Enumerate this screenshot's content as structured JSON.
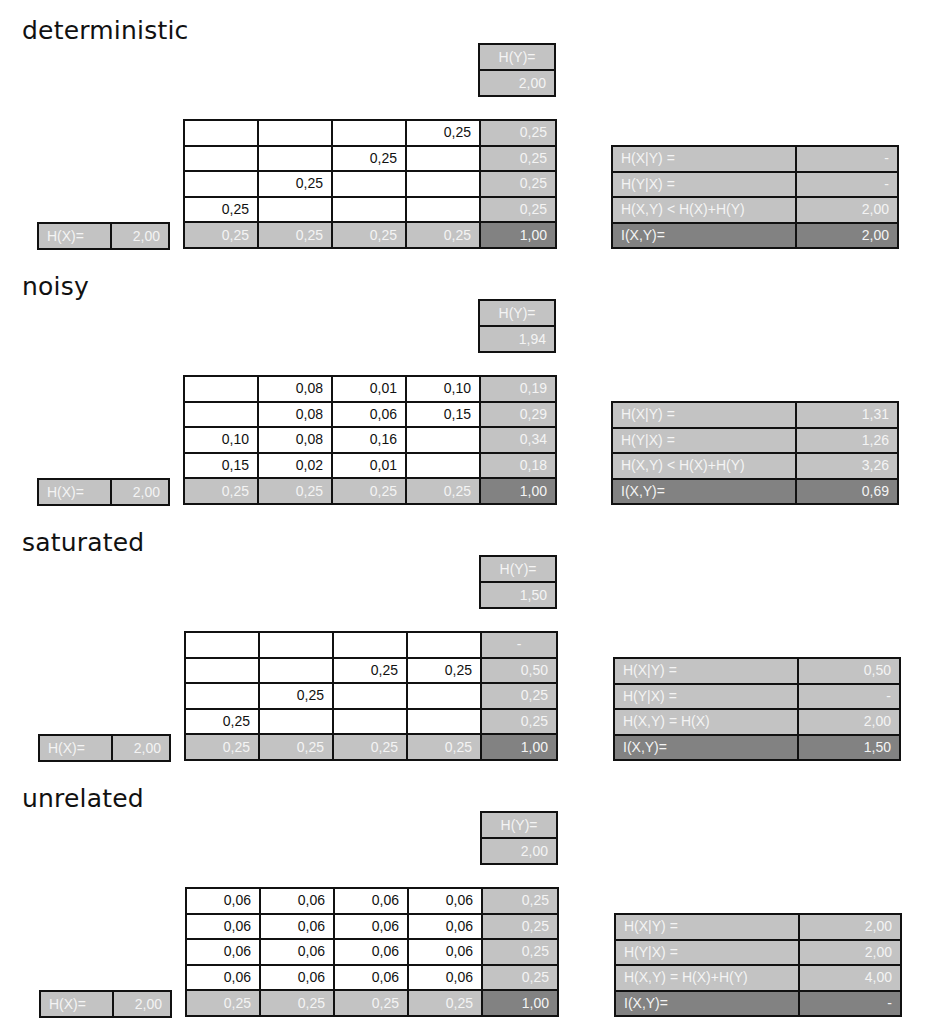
{
  "colors": {
    "light_gray": "#c3c3c3",
    "dark_gray": "#828282",
    "border": "#111111"
  },
  "sections": [
    {
      "title": "deterministic",
      "hy": {
        "label": "H(Y)=",
        "value": "2,00"
      },
      "grid": [
        [
          "",
          "",
          "",
          "0,25",
          "0,25"
        ],
        [
          "",
          "",
          "0,25",
          "",
          "0,25"
        ],
        [
          "",
          "0,25",
          "",
          "",
          "0,25"
        ],
        [
          "0,25",
          "",
          "",
          "",
          "0,25"
        ],
        [
          "0,25",
          "0,25",
          "0,25",
          "0,25",
          "1,00"
        ]
      ],
      "hx": {
        "label": "H(X)=",
        "value": "2,00"
      },
      "info": [
        {
          "label": "H(X|Y) =",
          "value": "-"
        },
        {
          "label": "H(Y|X) =",
          "value": "-"
        },
        {
          "label": "H(X,Y) < H(X)+H(Y)",
          "value": "2,00"
        },
        {
          "label": "I(X,Y)=",
          "value": "2,00"
        }
      ]
    },
    {
      "title": "noisy",
      "hy": {
        "label": "H(Y)=",
        "value": "1,94"
      },
      "grid": [
        [
          "",
          "0,08",
          "0,01",
          "0,10",
          "0,19"
        ],
        [
          "",
          "0,08",
          "0,06",
          "0,15",
          "0,29"
        ],
        [
          "0,10",
          "0,08",
          "0,16",
          "",
          "0,34"
        ],
        [
          "0,15",
          "0,02",
          "0,01",
          "",
          "0,18"
        ],
        [
          "0,25",
          "0,25",
          "0,25",
          "0,25",
          "1,00"
        ]
      ],
      "hx": {
        "label": "H(X)=",
        "value": "2,00"
      },
      "info": [
        {
          "label": "H(X|Y) =",
          "value": "1,31"
        },
        {
          "label": "H(Y|X) =",
          "value": "1,26"
        },
        {
          "label": "H(X,Y) < H(X)+H(Y)",
          "value": "3,26"
        },
        {
          "label": "I(X,Y)=",
          "value": "0,69"
        }
      ]
    },
    {
      "title": "saturated",
      "hy": {
        "label": "H(Y)=",
        "value": "1,50"
      },
      "grid": [
        [
          "",
          "",
          "",
          "",
          "-"
        ],
        [
          "",
          "",
          "0,25",
          "0,25",
          "0,50"
        ],
        [
          "",
          "0,25",
          "",
          "",
          "0,25"
        ],
        [
          "0,25",
          "",
          "",
          "",
          "0,25"
        ],
        [
          "0,25",
          "0,25",
          "0,25",
          "0,25",
          "1,00"
        ]
      ],
      "hx": {
        "label": "H(X)=",
        "value": "2,00"
      },
      "info": [
        {
          "label": "H(X|Y) =",
          "value": "0,50"
        },
        {
          "label": "H(Y|X) =",
          "value": "-"
        },
        {
          "label": "H(X,Y) = H(X)",
          "value": "2,00"
        },
        {
          "label": "I(X,Y)=",
          "value": "1,50"
        }
      ]
    },
    {
      "title": "unrelated",
      "hy": {
        "label": "H(Y)=",
        "value": "2,00"
      },
      "grid": [
        [
          "0,06",
          "0,06",
          "0,06",
          "0,06",
          "0,25"
        ],
        [
          "0,06",
          "0,06",
          "0,06",
          "0,06",
          "0,25"
        ],
        [
          "0,06",
          "0,06",
          "0,06",
          "0,06",
          "0,25"
        ],
        [
          "0,06",
          "0,06",
          "0,06",
          "0,06",
          "0,25"
        ],
        [
          "0,25",
          "0,25",
          "0,25",
          "0,25",
          "1,00"
        ]
      ],
      "hx": {
        "label": "H(X)=",
        "value": "2,00"
      },
      "info": [
        {
          "label": "H(X|Y) =",
          "value": "2,00"
        },
        {
          "label": "H(Y|X) =",
          "value": "2,00"
        },
        {
          "label": "H(X,Y) = H(X)+H(Y)",
          "value": "4,00"
        },
        {
          "label": "I(X,Y)=",
          "value": "-"
        }
      ]
    }
  ]
}
